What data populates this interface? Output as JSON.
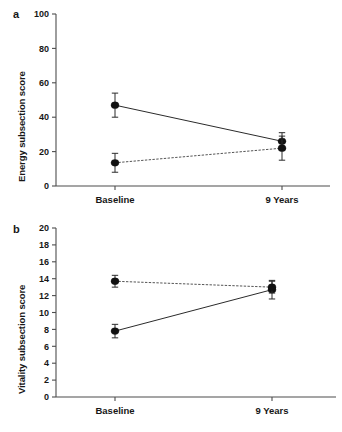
{
  "figure": {
    "background_color": "#ffffff",
    "ink_color": "#171717"
  },
  "panels": [
    {
      "id": "a",
      "label": "a",
      "ylabel": "Energy subsection score",
      "xlabel": "",
      "categories": [
        "Baseline",
        "9 Years"
      ],
      "yticks": [
        "0",
        "20",
        "40",
        "60",
        "80",
        "100"
      ]
    },
    {
      "id": "b",
      "label": "b",
      "ylabel": "Vitality subsection score",
      "xlabel": "",
      "categories": [
        "Baseline",
        "9 Years"
      ],
      "yticks": [
        "0",
        "2",
        "4",
        "6",
        "8",
        "10",
        "12",
        "14",
        "16",
        "18",
        "20"
      ]
    }
  ],
  "chart_data": [
    {
      "type": "line",
      "panel": "a",
      "title": "",
      "xlabel": "",
      "ylabel": "Energy subsection score",
      "categories": [
        "Baseline",
        "9 Years"
      ],
      "x": [
        0,
        1
      ],
      "ylim": [
        0,
        100
      ],
      "yticks": [
        0,
        20,
        40,
        60,
        80,
        100
      ],
      "grid": false,
      "legend": "none",
      "series": [
        {
          "name": "solid-line-group",
          "linestyle": "solid",
          "marker": "filled-circle",
          "color": "#111111",
          "values": [
            47,
            26
          ],
          "errors": [
            7,
            5
          ]
        },
        {
          "name": "dotted-line-group",
          "linestyle": "dotted",
          "marker": "filled-circle",
          "color": "#111111",
          "values": [
            13.5,
            22
          ],
          "errors": [
            5.5,
            7
          ]
        }
      ]
    },
    {
      "type": "line",
      "panel": "b",
      "title": "",
      "xlabel": "",
      "ylabel": "Vitality subsection score",
      "categories": [
        "Baseline",
        "9 Years"
      ],
      "x": [
        0,
        1
      ],
      "ylim": [
        0,
        20
      ],
      "yticks": [
        0,
        2,
        4,
        6,
        8,
        10,
        12,
        14,
        16,
        18,
        20
      ],
      "grid": false,
      "legend": "none",
      "series": [
        {
          "name": "solid-line-group",
          "linestyle": "solid",
          "marker": "filled-circle",
          "color": "#111111",
          "values": [
            7.8,
            12.7
          ],
          "errors": [
            0.8,
            1.1
          ]
        },
        {
          "name": "dotted-line-group",
          "linestyle": "dotted",
          "marker": "filled-circle",
          "color": "#111111",
          "values": [
            13.7,
            13.0
          ],
          "errors": [
            0.7,
            0.7
          ]
        }
      ]
    }
  ]
}
